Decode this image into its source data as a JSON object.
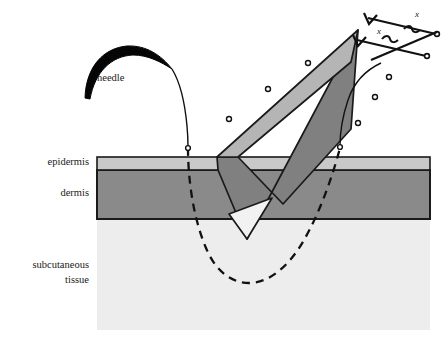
{
  "figure": {
    "background_color": "#ffffff"
  },
  "labels": {
    "needle": "needle",
    "epidermis": "epidermis",
    "dermis": "dermis",
    "subcutaneous_line1": "subcutaneous",
    "subcutaneous_line2": "tissue",
    "angle_x_upper": "x",
    "angle_x_lower": "x"
  },
  "colors": {
    "epidermis": "#c9c9c9",
    "dermis": "#8a8a8a",
    "subcutaneous": "#ededed",
    "blade_dark": "#808080",
    "blade_light": "#b5b5b5",
    "blade_tip": "#f2f2f2",
    "outline": "#1a1a1a",
    "needle_body": "#050505"
  },
  "geometry": {
    "skin_left": 97,
    "skin_right": 430,
    "epidermis_top": 157,
    "epidermis_bottom": 170,
    "dermis_bottom": 219,
    "subcutaneous_bottom": 330
  },
  "particles": [
    {
      "cx": 308,
      "cy": 63
    },
    {
      "cx": 268,
      "cy": 89
    },
    {
      "cx": 229,
      "cy": 119
    },
    {
      "cx": 389,
      "cy": 77
    },
    {
      "cx": 375,
      "cy": 97
    },
    {
      "cx": 358,
      "cy": 123
    }
  ]
}
